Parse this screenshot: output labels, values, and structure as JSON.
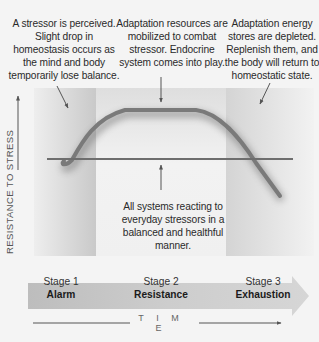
{
  "annotations": {
    "alarm": "A stressor is perceived. Slight drop in homeostasis occurs as the mind and body temporarily lose balance.",
    "resistance": "Adaptation resources are mobilized to combat stressor. Endocrine system comes into play.",
    "exhaustion": "Adaptation energy stores are depleted. Replenish them, and the body will return to homeostatic state.",
    "baseline": "All systems reacting to everyday stressors in a balanced and healthful manner."
  },
  "axes": {
    "y_label": "RESISTANCE TO STRESS",
    "x_label": "T I M E"
  },
  "stages": [
    {
      "number": "Stage 1",
      "name": "Alarm"
    },
    {
      "number": "Stage 2",
      "name": "Resistance"
    },
    {
      "number": "Stage 3",
      "name": "Exhaustion"
    }
  ],
  "colors": {
    "curve": "#7a7a7a",
    "baseline": "#6e6e6e",
    "alarm_panel": "#cfcfcf",
    "resistance_panel": "#e9e9e9",
    "exhaustion_panel": "#d6d6d6",
    "stage_band": "#c4c4c4"
  }
}
